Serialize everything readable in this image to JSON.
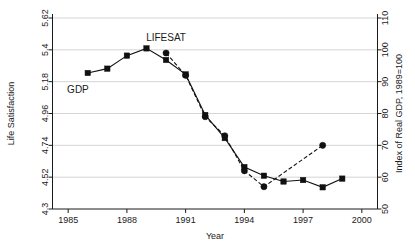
{
  "chart_data": {
    "type": "line",
    "title": "",
    "xlabel": "Year",
    "ylabel": "Life Satisfaction",
    "y2label": "Index of Real GDP, 1989=100",
    "xlim": [
      1984.2,
      2000.8
    ],
    "ylim": [
      4.3,
      5.62
    ],
    "y2lim": [
      50,
      110
    ],
    "grid": true,
    "legend_position": "inline-annotations",
    "x_ticks": [
      "1985",
      "1988",
      "1991",
      "1994",
      "1997",
      "2000"
    ],
    "x_tick_values": [
      1985,
      1988,
      1991,
      1994,
      1997,
      2000
    ],
    "y_ticks": [
      "4.3",
      "4.52",
      "4.74",
      "4.96",
      "5.18",
      "5.4",
      "5.62"
    ],
    "y_tick_values": [
      4.3,
      4.52,
      4.74,
      4.96,
      5.18,
      5.4,
      5.62
    ],
    "y2_ticks": [
      "50",
      "60",
      "70",
      "80",
      "90",
      "100",
      "110"
    ],
    "y2_tick_values": [
      50,
      60,
      70,
      80,
      90,
      100,
      110
    ],
    "annotations": [
      {
        "text": "LIFESAT",
        "x": 1990.0,
        "y_axis": "left",
        "y": 5.46
      },
      {
        "text": "GDP",
        "x": 1985.5,
        "y_axis": "left",
        "y": 5.1
      }
    ],
    "series": [
      {
        "name": "LIFESAT",
        "axis": "left",
        "marker": "square",
        "linestyle": "solid",
        "color": "#111111",
        "x": [
          1986,
          1987,
          1988,
          1989,
          1990,
          1991,
          1992,
          1993,
          1994,
          1995,
          1996,
          1997,
          1998,
          1999
        ],
        "values": [
          5.24,
          5.27,
          5.36,
          5.41,
          5.33,
          5.23,
          4.95,
          4.79,
          4.59,
          4.53,
          4.49,
          4.5,
          4.45,
          4.51
        ]
      },
      {
        "name": "GDP",
        "axis": "right",
        "marker": "circle",
        "linestyle": "dashed",
        "color": "#111111",
        "x": [
          1990,
          1991,
          1992,
          1993,
          1994,
          1995,
          1998
        ],
        "values": [
          99,
          92,
          79,
          73,
          62,
          57,
          70
        ]
      }
    ]
  },
  "axes": {
    "left_title": "Life Satisfaction",
    "right_title": "Index of Real GDP, 1989=100",
    "bottom_title": "Year"
  }
}
